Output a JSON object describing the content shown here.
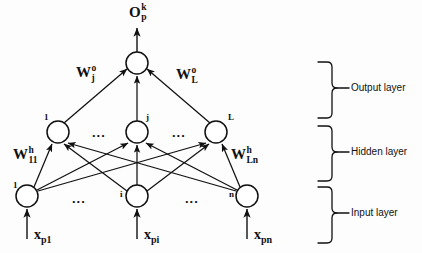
{
  "diagram": {
    "output_label": {
      "base": "O",
      "sup": "k",
      "sub": "p"
    },
    "weights": {
      "output_left": {
        "base": "W",
        "sup": "o",
        "sub": "j"
      },
      "output_right": {
        "base": "W",
        "sup": "o",
        "sub": "L"
      },
      "hidden_left": {
        "base": "W",
        "sup": "h",
        "sub": "11"
      },
      "hidden_right": {
        "base": "W",
        "sup": "h",
        "sub": "Ln"
      }
    },
    "output_nodes": [
      {
        "index": "",
        "cx": 137,
        "cy": 63,
        "r": 11
      }
    ],
    "hidden_nodes": [
      {
        "index": "1",
        "cx": 58,
        "cy": 132,
        "r": 11
      },
      {
        "index": "j",
        "cx": 137,
        "cy": 132,
        "r": 11
      },
      {
        "index": "L",
        "cx": 216,
        "cy": 132,
        "r": 11
      }
    ],
    "input_nodes": [
      {
        "index": "1",
        "cx": 27,
        "cy": 196,
        "r": 11,
        "label": {
          "base": "x",
          "sub": "p1"
        }
      },
      {
        "index": "i",
        "cx": 137,
        "cy": 196,
        "r": 11,
        "label": {
          "base": "x",
          "sub": "pi"
        }
      },
      {
        "index": "n",
        "cx": 247,
        "cy": 196,
        "r": 11,
        "label": {
          "base": "x",
          "sub": "pn"
        }
      }
    ],
    "ellipses": [
      {
        "text": "...",
        "x": 92,
        "y": 126
      },
      {
        "text": "...",
        "x": 172,
        "y": 126
      },
      {
        "text": "...",
        "x": 72,
        "y": 192
      },
      {
        "text": "...",
        "x": 185,
        "y": 192
      }
    ],
    "layer_braces": [
      {
        "name": "Output layer",
        "label_x": 359,
        "label_y": 88,
        "top": 62,
        "bottom": 118
      },
      {
        "name": "Hidden layer",
        "label_x": 359,
        "label_y": 152,
        "top": 126,
        "bottom": 181
      },
      {
        "name": "Input layer",
        "label_x": 359,
        "label_y": 213,
        "top": 187,
        "bottom": 243
      }
    ],
    "colors": {
      "stroke": "#111111",
      "node_fill": "#ffffff",
      "background": "#fdfdfd",
      "text": "#111111"
    }
  }
}
